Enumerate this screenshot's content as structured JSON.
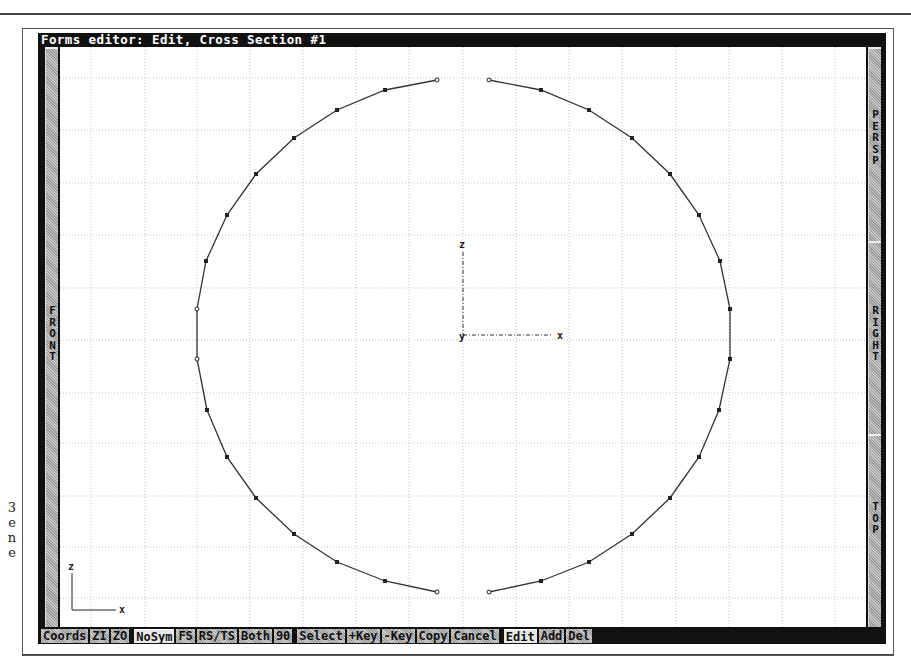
{
  "window": {
    "title": "Forms editor: Edit, Cross Section #1"
  },
  "side_views": {
    "left": {
      "label": "FRONT"
    },
    "right": [
      {
        "label": "PERSP"
      },
      {
        "label": "RIGHT"
      },
      {
        "label": "TOP"
      }
    ]
  },
  "toolbar": {
    "buttons": [
      {
        "label": "Coords",
        "active": false
      },
      {
        "label": "ZI",
        "active": false
      },
      {
        "label": "ZO",
        "active": false
      },
      {
        "label": "NoSym",
        "active": true
      },
      {
        "label": "FS",
        "active": false
      },
      {
        "label": "RS/TS",
        "active": false
      },
      {
        "label": "Both",
        "active": false
      },
      {
        "label": "90",
        "active": false
      },
      {
        "label": "Select",
        "active": false
      },
      {
        "label": "+Key",
        "active": false
      },
      {
        "label": "-Key",
        "active": false
      },
      {
        "label": "Copy",
        "active": false
      },
      {
        "label": "Cancel",
        "active": false
      },
      {
        "label": "Edit",
        "active": true
      },
      {
        "label": "Add",
        "active": false
      },
      {
        "label": "Del",
        "active": false
      }
    ]
  },
  "canvas": {
    "origin_axes": {
      "z_label": "z",
      "x_label": "x",
      "y_label": "y"
    },
    "corner_axes": {
      "z_label": "z",
      "x_label": "x"
    },
    "colors": {
      "grid": "#c8c8c8",
      "curve": "#333333",
      "point": "#222222"
    }
  },
  "page_margin_text": [
    "3",
    "e",
    "n",
    "e"
  ]
}
